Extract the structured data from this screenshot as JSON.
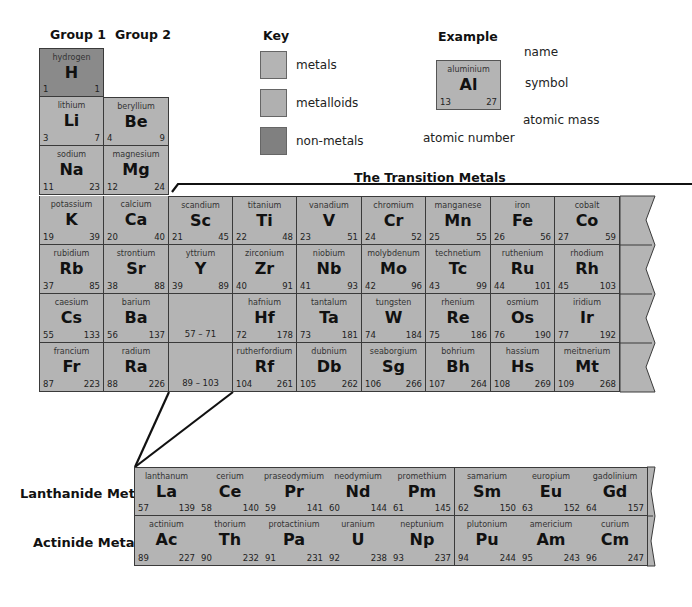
{
  "headers": {
    "group1": "Group 1",
    "group2": "Group 2",
    "key": "Key",
    "example": "Example",
    "transition": "The Transition Metals",
    "lanthanide": "Lanthanide Metals",
    "actinide": "Actinide Metals"
  },
  "key": {
    "items": [
      {
        "label": "metals",
        "color": "#b4b4b4"
      },
      {
        "label": "metalloids",
        "color": "#b0b0b0"
      },
      {
        "label": "non-metals",
        "color": "#808080"
      }
    ]
  },
  "example": {
    "element": {
      "name": "aluminium",
      "symbol": "Al",
      "number": "13",
      "mass": "27"
    },
    "labels": {
      "name": "name",
      "symbol": "symbol",
      "atomic_mass": "atomic mass",
      "atomic_number": "atomic number"
    }
  },
  "colors": {
    "metal": "#b4b4b4",
    "nonmetal": "#8a8a8a",
    "border": "#3a3a3a"
  },
  "main_table": {
    "rows": [
      [
        {
          "name": "hydrogen",
          "symbol": "H",
          "number": "1",
          "mass": "1",
          "type": "nonmetal"
        }
      ],
      [
        {
          "name": "lithium",
          "symbol": "Li",
          "number": "3",
          "mass": "7"
        },
        {
          "name": "beryllium",
          "symbol": "Be",
          "number": "4",
          "mass": "9"
        }
      ],
      [
        {
          "name": "sodium",
          "symbol": "Na",
          "number": "11",
          "mass": "23"
        },
        {
          "name": "magnesium",
          "symbol": "Mg",
          "number": "12",
          "mass": "24"
        }
      ],
      [
        {
          "name": "potassium",
          "symbol": "K",
          "number": "19",
          "mass": "39"
        },
        {
          "name": "calcium",
          "symbol": "Ca",
          "number": "20",
          "mass": "40"
        },
        {
          "name": "scandium",
          "symbol": "Sc",
          "number": "21",
          "mass": "45"
        },
        {
          "name": "titanium",
          "symbol": "Ti",
          "number": "22",
          "mass": "48"
        },
        {
          "name": "vanadium",
          "symbol": "V",
          "number": "23",
          "mass": "51"
        },
        {
          "name": "chromium",
          "symbol": "Cr",
          "number": "24",
          "mass": "52"
        },
        {
          "name": "manganese",
          "symbol": "Mn",
          "number": "25",
          "mass": "55"
        },
        {
          "name": "iron",
          "symbol": "Fe",
          "number": "26",
          "mass": "56"
        },
        {
          "name": "cobalt",
          "symbol": "Co",
          "number": "27",
          "mass": "59"
        }
      ],
      [
        {
          "name": "rubidium",
          "symbol": "Rb",
          "number": "37",
          "mass": "85"
        },
        {
          "name": "strontium",
          "symbol": "Sr",
          "number": "38",
          "mass": "88"
        },
        {
          "name": "yttrium",
          "symbol": "Y",
          "number": "39",
          "mass": "89"
        },
        {
          "name": "zirconium",
          "symbol": "Zr",
          "number": "40",
          "mass": "91"
        },
        {
          "name": "niobium",
          "symbol": "Nb",
          "number": "41",
          "mass": "93"
        },
        {
          "name": "molybdenum",
          "symbol": "Mo",
          "number": "42",
          "mass": "96"
        },
        {
          "name": "technetium",
          "symbol": "Tc",
          "number": "43",
          "mass": "99"
        },
        {
          "name": "ruthenium",
          "symbol": "Ru",
          "number": "44",
          "mass": "101"
        },
        {
          "name": "rhodium",
          "symbol": "Rh",
          "number": "45",
          "mass": "103"
        }
      ],
      [
        {
          "name": "caesium",
          "symbol": "Cs",
          "number": "55",
          "mass": "133"
        },
        {
          "name": "barium",
          "symbol": "Ba",
          "number": "56",
          "mass": "137"
        },
        {
          "range": "57 – 71"
        },
        {
          "name": "hafnium",
          "symbol": "Hf",
          "number": "72",
          "mass": "178"
        },
        {
          "name": "tantalum",
          "symbol": "Ta",
          "number": "73",
          "mass": "181"
        },
        {
          "name": "tungsten",
          "symbol": "W",
          "number": "74",
          "mass": "184"
        },
        {
          "name": "rhenium",
          "symbol": "Re",
          "number": "75",
          "mass": "186"
        },
        {
          "name": "osmium",
          "symbol": "Os",
          "number": "76",
          "mass": "190"
        },
        {
          "name": "iridium",
          "symbol": "Ir",
          "number": "77",
          "mass": "192"
        }
      ],
      [
        {
          "name": "francium",
          "symbol": "Fr",
          "number": "87",
          "mass": "223"
        },
        {
          "name": "radium",
          "symbol": "Ra",
          "number": "88",
          "mass": "226"
        },
        {
          "range": "89 – 103"
        },
        {
          "name": "rutherfordium",
          "symbol": "Rf",
          "number": "104",
          "mass": "261"
        },
        {
          "name": "dubnium",
          "symbol": "Db",
          "number": "105",
          "mass": "262"
        },
        {
          "name": "seaborgium",
          "symbol": "Sg",
          "number": "106",
          "mass": "266"
        },
        {
          "name": "bohrium",
          "symbol": "Bh",
          "number": "107",
          "mass": "264"
        },
        {
          "name": "hassium",
          "symbol": "Hs",
          "number": "108",
          "mass": "269"
        },
        {
          "name": "meitnerium",
          "symbol": "Mt",
          "number": "109",
          "mass": "268"
        }
      ]
    ]
  },
  "f_block": {
    "lanthanides": [
      {
        "name": "lanthanum",
        "symbol": "La",
        "number": "57",
        "mass": "139"
      },
      {
        "name": "cerium",
        "symbol": "Ce",
        "number": "58",
        "mass": "140"
      },
      {
        "name": "praseodymium",
        "symbol": "Pr",
        "number": "59",
        "mass": "141"
      },
      {
        "name": "neodymium",
        "symbol": "Nd",
        "number": "60",
        "mass": "144"
      },
      {
        "name": "promethium",
        "symbol": "Pm",
        "number": "61",
        "mass": "145"
      },
      {
        "name": "samarium",
        "symbol": "Sm",
        "number": "62",
        "mass": "150"
      },
      {
        "name": "europium",
        "symbol": "Eu",
        "number": "63",
        "mass": "152"
      },
      {
        "name": "gadolinium",
        "symbol": "Gd",
        "number": "64",
        "mass": "157"
      }
    ],
    "actinides": [
      {
        "name": "actinium",
        "symbol": "Ac",
        "number": "89",
        "mass": "227"
      },
      {
        "name": "thorium",
        "symbol": "Th",
        "number": "90",
        "mass": "232"
      },
      {
        "name": "protactinium",
        "symbol": "Pa",
        "number": "91",
        "mass": "231"
      },
      {
        "name": "uranium",
        "symbol": "U",
        "number": "92",
        "mass": "238"
      },
      {
        "name": "neptunium",
        "symbol": "Np",
        "number": "93",
        "mass": "237"
      },
      {
        "name": "plutonium",
        "symbol": "Pu",
        "number": "94",
        "mass": "244"
      },
      {
        "name": "americium",
        "symbol": "Am",
        "number": "95",
        "mass": "243"
      },
      {
        "name": "curium",
        "symbol": "Cm",
        "number": "96",
        "mass": "247"
      }
    ]
  }
}
